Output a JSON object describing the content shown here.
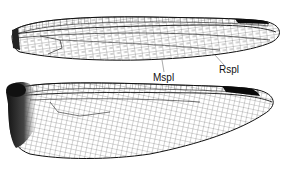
{
  "figure": {
    "wings": [
      {
        "id": "forewing",
        "label": ""
      },
      {
        "id": "hindwing",
        "label": ""
      }
    ],
    "annotations": [
      {
        "text": "Mspl",
        "meaning": "median supplementary vein",
        "x": 153,
        "y": 74
      },
      {
        "text": "Rspl",
        "meaning": "radial supplementary vein",
        "x": 219,
        "y": 66
      }
    ],
    "colors": {
      "vein": "#1a1a1a",
      "pterostigma": "#0a0a0a",
      "basal_patch": "#202020",
      "background": "#ffffff"
    }
  }
}
